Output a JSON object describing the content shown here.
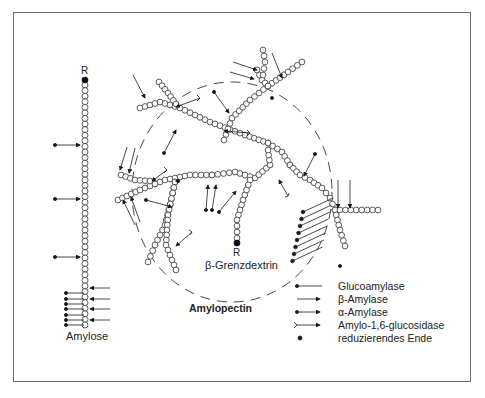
{
  "figure": {
    "labels": {
      "amylose": "Amylose",
      "amylopectin": "Amylopectin",
      "limit_dextrin": "β-Grenzdextrin",
      "reducing_end_amylose": "R",
      "reducing_end_limit_dextrin": "R"
    },
    "legend": [
      {
        "symbol": "dot-line",
        "label": "Glucoamylase"
      },
      {
        "symbol": "arrow",
        "label": "β-Amylase"
      },
      {
        "symbol": "dot-arrow",
        "label": "α-Amylase"
      },
      {
        "symbol": "fork-arrow",
        "label": "Amylo-1,6-glucosidase"
      },
      {
        "symbol": "filled-dot",
        "label": "reduzierendes Ende"
      }
    ],
    "colors": {
      "stroke": "#1a1a1a",
      "frame": "#6e6e6e",
      "dashed_circle": "#333333",
      "background": "#ffffff"
    }
  }
}
